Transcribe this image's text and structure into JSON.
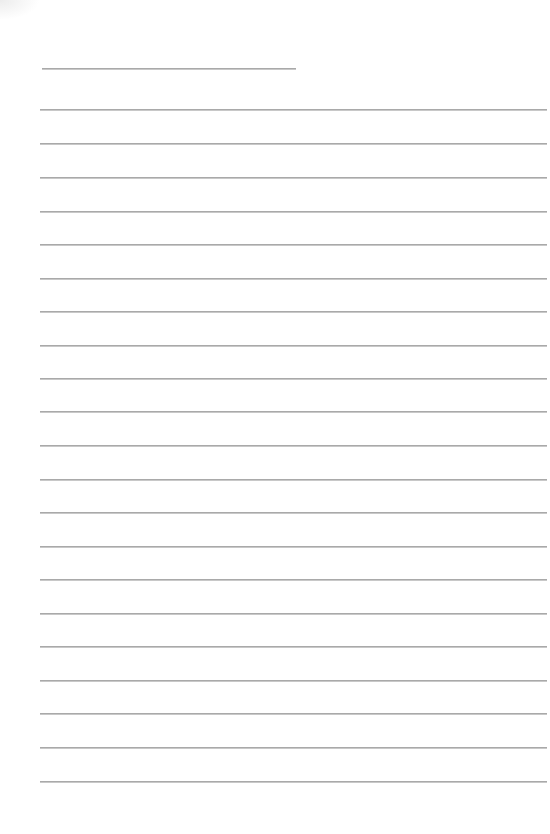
{
  "document": {
    "type": "lined-paper",
    "background_color": "#ffffff",
    "line_color": "#a9a9a9",
    "title_line": {
      "label": "",
      "x": 42,
      "y": 68,
      "width": 254
    },
    "ruled_lines": {
      "count": 21,
      "x": 40,
      "width": 507,
      "y_positions": [
        109,
        143,
        177,
        211,
        244,
        278,
        311,
        345,
        378,
        411,
        445,
        479,
        512,
        546,
        579,
        613,
        646,
        680,
        713,
        747,
        781
      ],
      "values": [
        "",
        "",
        "",
        "",
        "",
        "",
        "",
        "",
        "",
        "",
        "",
        "",
        "",
        "",
        "",
        "",
        "",
        "",
        "",
        "",
        ""
      ]
    }
  }
}
